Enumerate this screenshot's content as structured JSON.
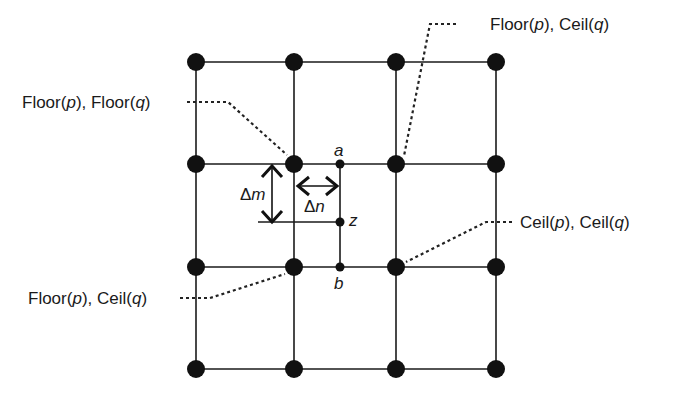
{
  "diagram": {
    "type": "bilinear-interpolation-grid",
    "colors": {
      "ink": "#1a1a1a",
      "background": "#ffffff"
    },
    "grid": {
      "columns_x": [
        196,
        294,
        396,
        496
      ],
      "rows_y": [
        62,
        164,
        267,
        369
      ],
      "node_radius": 9
    },
    "points": {
      "a": {
        "label": "a",
        "x": 340,
        "y": 164
      },
      "z": {
        "label": "z",
        "x": 340,
        "y": 222
      },
      "b": {
        "label": "b",
        "x": 340,
        "y": 267
      }
    },
    "deltas": {
      "m": {
        "symbol": "Δ",
        "var": "m"
      },
      "n": {
        "symbol": "Δ",
        "var": "n"
      }
    },
    "callouts": {
      "floor_p_floor_q": {
        "f1": "Floor(",
        "v1": "p",
        "mid": "), Floor(",
        "v2": "q",
        "end": ")"
      },
      "floor_p_ceil_q_top": {
        "f1": "Floor(",
        "v1": "p",
        "mid": "), Ceil(",
        "v2": "q",
        "end": ")"
      },
      "ceil_p_ceil_q": {
        "f1": "Ceil(",
        "v1": "p",
        "mid": "), Ceil(",
        "v2": "q",
        "end": ")"
      },
      "floor_p_ceil_q_bottom": {
        "f1": "Floor(",
        "v1": "p",
        "mid": "), Ceil(",
        "v2": "q",
        "end": ")"
      }
    }
  }
}
